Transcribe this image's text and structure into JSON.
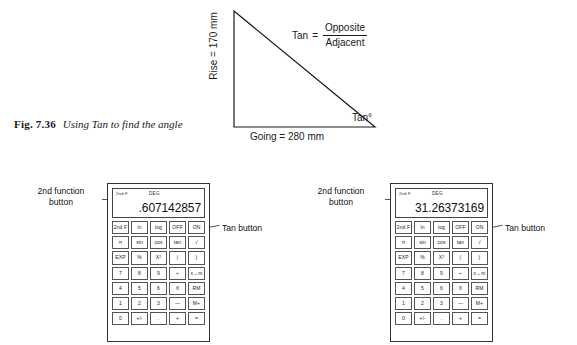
{
  "figure": {
    "number": "Fig. 7.36",
    "caption": "Using Tan to find the angle"
  },
  "diagram": {
    "type": "right-triangle-trigonometry",
    "rise_label": "Rise = 170 mm",
    "going_label": "Going = 280 mm",
    "angle_label": "Tan°",
    "formula": {
      "lhs": "Tan",
      "equals": "=",
      "numerator": "Opposite",
      "denominator": "Adjacent"
    },
    "values": {
      "rise_mm": 170,
      "going_mm": 280,
      "tan_ratio": 0.607142857,
      "angle_degrees": 31.26373169
    }
  },
  "calculators": [
    {
      "id": "left",
      "display": {
        "second_function_indicator": "2nd F",
        "mode": "DEG",
        "value": ".607142857"
      },
      "keys": [
        "2nd F",
        "ln",
        "log",
        "OFF",
        "ON",
        "π",
        "sin",
        "cos",
        "tan",
        "√",
        "EXP",
        "%",
        "X2",
        "(",
        ")",
        "7",
        "8",
        "9",
        "÷",
        "x→m",
        "4",
        "5",
        "6",
        "X",
        "RM",
        "1",
        "2",
        "3",
        "—",
        "M+",
        "0",
        "+/-",
        ".",
        "+",
        "="
      ],
      "callouts": {
        "second_function": "2nd function\nbutton",
        "tan": "Tan button"
      }
    },
    {
      "id": "right",
      "display": {
        "second_function_indicator": "2nd F",
        "mode": "DEG",
        "value": "31.26373169"
      },
      "keys": [
        "2nd F",
        "ln",
        "log",
        "OFF",
        "ON",
        "π",
        "sin",
        "cos",
        "tan",
        "√",
        "EXP",
        "%",
        "X2",
        "(",
        ")",
        "7",
        "8",
        "9",
        "÷",
        "x→m",
        "4",
        "5",
        "6",
        "X",
        "RM",
        "1",
        "2",
        "3",
        "—",
        "M+",
        "0",
        "+/-",
        ".",
        "+",
        "="
      ],
      "callouts": {
        "second_function": "2nd function\nbutton",
        "tan": "Tan button"
      }
    }
  ],
  "colors": {
    "ink": "#1a1a1a",
    "line": "#333333",
    "background": "#ffffff"
  }
}
